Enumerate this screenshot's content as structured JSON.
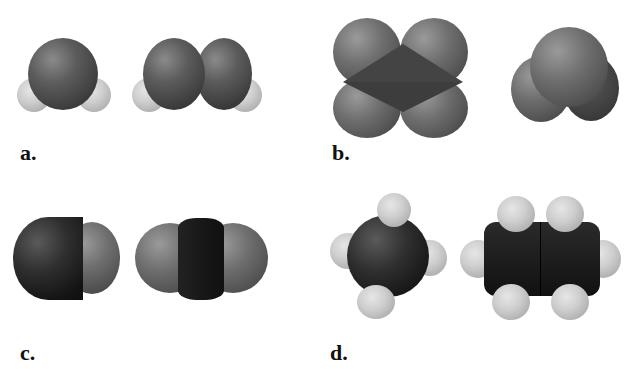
{
  "figure": {
    "panels": [
      {
        "label": "a.",
        "molecules": [
          "bent-triatomic",
          "chain-with-two-end-atoms"
        ]
      },
      {
        "label": "b.",
        "molecules": [
          "four-sphere-cluster",
          "three-sphere-angled"
        ]
      },
      {
        "label": "c.",
        "molecules": [
          "diatomic",
          "linear-triatomic"
        ]
      },
      {
        "label": "d.",
        "molecules": [
          "tetrahedral-with-four-small-atoms",
          "ethane-like"
        ]
      }
    ]
  }
}
